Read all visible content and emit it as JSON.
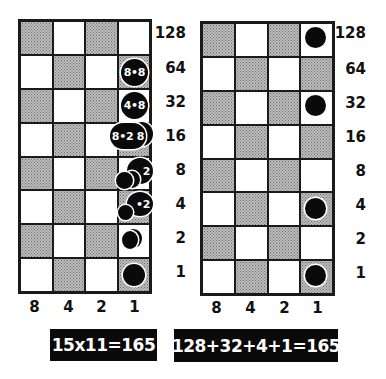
{
  "left_panel": {
    "title": "Multiplication by doubling",
    "row_labels": [
      "128",
      "64",
      "32",
      "16",
      "8",
      "4",
      "2",
      "1"
    ],
    "col_labels": [
      "8",
      "4",
      "2",
      "1"
    ],
    "counters": [
      {
        "row": "64",
        "label": "8•8"
      },
      {
        "row": "32",
        "label": "4•8"
      },
      {
        "row": "16",
        "label": "8•2 8"
      },
      {
        "row": "8",
        "label": "2"
      },
      {
        "row": "4",
        "label": "•2"
      },
      {
        "row": "2",
        "label": ""
      },
      {
        "row": "1",
        "label": ""
      }
    ],
    "formula": "15x11=165"
  },
  "right_panel": {
    "row_labels": [
      "128",
      "64",
      "32",
      "16",
      "8",
      "4",
      "2",
      "1"
    ],
    "col_labels": [
      "8",
      "4",
      "2",
      "1"
    ],
    "counter_rows": [
      "128",
      "32",
      "4",
      "1"
    ],
    "formula": "128+32+4+1=165"
  },
  "colors": {
    "ink": "#0a0a0a",
    "shade": "#bdbdbd",
    "background": "#ffffff"
  }
}
